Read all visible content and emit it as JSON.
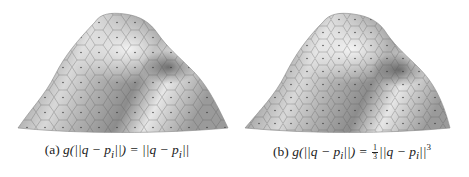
{
  "figure": {
    "panels": [
      {
        "id": "a",
        "label": "(a)",
        "caption_lhs": "g(||q − p",
        "caption_sub": "i",
        "caption_mid": "||) = ||q − p",
        "caption_sub2": "i",
        "caption_end": "||",
        "description": "Shaded 3D terrain surface with Voronoi cell tessellation and site points"
      },
      {
        "id": "b",
        "label": "(b)",
        "caption_lhs": "g(||q − p",
        "caption_sub": "i",
        "caption_mid": "||) = ",
        "frac_num": "1",
        "frac_den": "3",
        "caption_rest": "||q − p",
        "caption_sub2": "i",
        "caption_end": "||",
        "exponent": "3",
        "description": "Shaded 3D terrain surface with Voronoi cell tessellation and site points"
      }
    ],
    "colors": {
      "surface_light": "#f2f2f2",
      "surface_mid": "#a8a8a8",
      "surface_dark": "#6a6a6a",
      "cell_edge": "#555555",
      "caption_text": "#222222"
    }
  }
}
